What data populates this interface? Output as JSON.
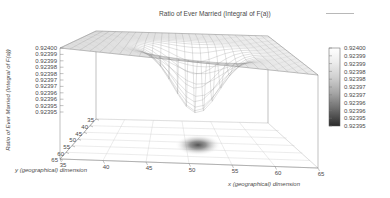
{
  "title": "Ratio of Ever Married (Integral of F(a))",
  "legend": {
    "key_label": "Ratio of Ever Married (Integral of F(a))",
    "key_sample": "line-sample"
  },
  "axes": {
    "z_label": "Ratio of Ever Married (Integral of F(a))",
    "x_label": "x (geographical) dimension",
    "y_label": "y (geographical) dimension",
    "z_ticks": [
      "0.92400",
      "0.92399",
      "0.92399",
      "0.92398",
      "0.92398",
      "0.92397",
      "0.92397",
      "0.92396",
      "0.92396",
      "0.92395",
      "0.92395"
    ],
    "x_ticks": [
      "35",
      "40",
      "45",
      "50",
      "55",
      "60",
      "65"
    ],
    "y_ticks": [
      "65",
      "60",
      "55",
      "50",
      "45",
      "40",
      "35"
    ],
    "x_range": [
      35,
      65
    ],
    "y_range": [
      35,
      65
    ],
    "z_range": [
      0.92395,
      0.924
    ]
  },
  "colorbar": {
    "labels": [
      "0.92400",
      "0.92399",
      "0.92399",
      "0.92398",
      "0.92398",
      "0.92397",
      "0.92397",
      "0.92396",
      "0.92396",
      "0.92395",
      "0.92395"
    ],
    "top_color": "#ffffff",
    "bottom_color": "#2a2a2a",
    "orientation": "vertical"
  },
  "chart_data": {
    "type": "surface",
    "title": "Ratio of Ever Married (Integral of F(a))",
    "xlabel": "x (geographical) dimension",
    "ylabel": "y (geographical) dimension",
    "zlabel": "Ratio of Ever Married (Integral of F(a))",
    "xlim": [
      35,
      65
    ],
    "ylim": [
      35,
      65
    ],
    "zlim": [
      0.92395,
      0.924
    ],
    "grid": true,
    "legend_position": "top-center",
    "surface_description": "Near-flat plane at z=0.92400 with a single steep gaussian-like depression (funnel) centred near x=52, y=48 dipping below 0.92395",
    "baseline_value": 0.924,
    "dip_center": [
      52,
      48
    ],
    "dip_min_value": 0.92393,
    "dip_radius": 7,
    "mesh_nx": 26,
    "mesh_ny": 26,
    "base_contour": "dark filled blob projected on the xy floor under the depression"
  }
}
